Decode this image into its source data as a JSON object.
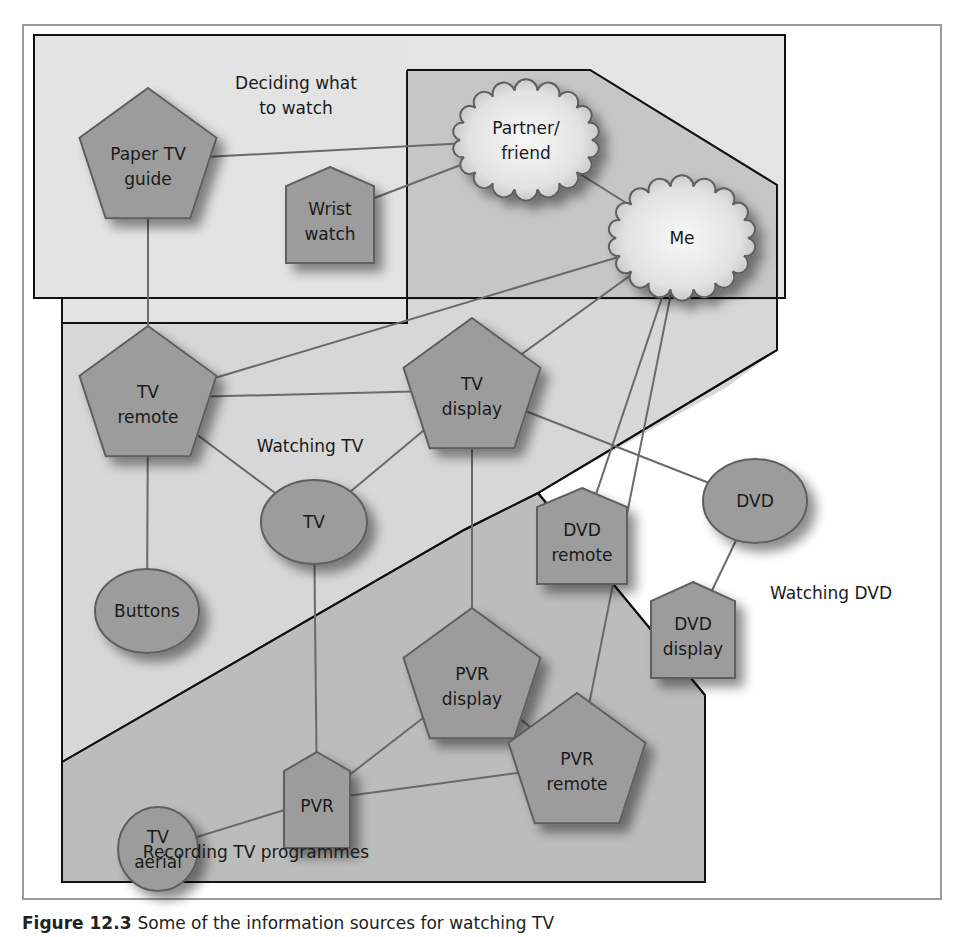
{
  "figure": {
    "caption_number": "Figure 12.3",
    "caption_text": "Some of the information sources for watching TV"
  },
  "colors": {
    "node_fill": "#9c9c9c",
    "node_stroke": "#5e5e5e",
    "cloud_fill_center": "#f4f4f4",
    "cloud_fill_edge": "#b8b8b8",
    "region_light": "#d8d8d8",
    "region_dark": "#bdbdbd",
    "edge": "#6a6a6a",
    "region_border": "#1a1a1a"
  },
  "regions": [
    {
      "id": "deciding",
      "label_lines": [
        "Deciding what",
        "to watch"
      ]
    },
    {
      "id": "watching_tv",
      "label_lines": [
        "Watching TV"
      ]
    },
    {
      "id": "recording",
      "label_lines": [
        "Recording TV programmes"
      ]
    },
    {
      "id": "watching_dvd",
      "label_lines": [
        "Watching DVD"
      ]
    }
  ],
  "nodes": [
    {
      "id": "paper_tv_guide",
      "shape": "pentagon",
      "label_lines": [
        "Paper TV",
        "guide"
      ]
    },
    {
      "id": "wrist_watch",
      "shape": "house",
      "label_lines": [
        "Wrist",
        "watch"
      ]
    },
    {
      "id": "partner_friend",
      "shape": "cloud",
      "label_lines": [
        "Partner/",
        "friend"
      ]
    },
    {
      "id": "me",
      "shape": "cloud",
      "label_lines": [
        "Me"
      ]
    },
    {
      "id": "tv_remote",
      "shape": "pentagon",
      "label_lines": [
        "TV",
        "remote"
      ]
    },
    {
      "id": "tv_display",
      "shape": "pentagon",
      "label_lines": [
        "TV",
        "display"
      ]
    },
    {
      "id": "tv",
      "shape": "ellipse",
      "label_lines": [
        "TV"
      ]
    },
    {
      "id": "buttons",
      "shape": "ellipse",
      "label_lines": [
        "Buttons"
      ]
    },
    {
      "id": "dvd_remote",
      "shape": "house",
      "label_lines": [
        "DVD",
        "remote"
      ]
    },
    {
      "id": "dvd",
      "shape": "ellipse",
      "label_lines": [
        "DVD"
      ]
    },
    {
      "id": "dvd_display",
      "shape": "house",
      "label_lines": [
        "DVD",
        "display"
      ]
    },
    {
      "id": "pvr_display",
      "shape": "pentagon",
      "label_lines": [
        "PVR",
        "display"
      ]
    },
    {
      "id": "pvr",
      "shape": "house",
      "label_lines": [
        "PVR"
      ]
    },
    {
      "id": "tv_aerial",
      "shape": "ellipse",
      "label_lines": [
        "TV",
        "aerial"
      ]
    },
    {
      "id": "pvr_remote",
      "shape": "pentagon",
      "label_lines": [
        "PVR",
        "remote"
      ]
    }
  ],
  "edges": [
    [
      "paper_tv_guide",
      "partner_friend"
    ],
    [
      "wrist_watch",
      "partner_friend"
    ],
    [
      "partner_friend",
      "me"
    ],
    [
      "paper_tv_guide",
      "tv_remote"
    ],
    [
      "me",
      "tv_remote"
    ],
    [
      "me",
      "tv_display"
    ],
    [
      "me",
      "dvd_remote"
    ],
    [
      "me",
      "pvr_remote"
    ],
    [
      "tv_remote",
      "tv_display"
    ],
    [
      "tv_remote",
      "tv"
    ],
    [
      "tv_remote",
      "buttons"
    ],
    [
      "tv",
      "tv_display"
    ],
    [
      "tv_display",
      "dvd"
    ],
    [
      "tv_display",
      "pvr_display"
    ],
    [
      "tv",
      "pvr"
    ],
    [
      "dvd",
      "dvd_display"
    ],
    [
      "pvr",
      "pvr_display"
    ],
    [
      "pvr",
      "tv_aerial"
    ],
    [
      "pvr",
      "pvr_remote"
    ],
    [
      "pvr_display",
      "pvr_remote"
    ]
  ]
}
